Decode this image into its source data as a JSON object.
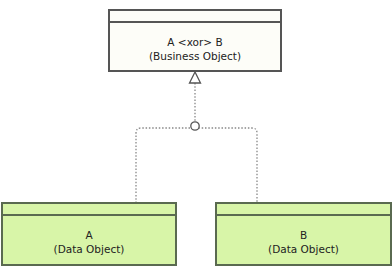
{
  "diagram": {
    "nodes": [
      {
        "id": "top",
        "line1": "A <xor> B",
        "line2": "(Business Object)",
        "fill": "#fdfdf8"
      },
      {
        "id": "a",
        "line1": "A",
        "line2": "(Data Object)",
        "fill": "#d8f5a8"
      },
      {
        "id": "b",
        "line1": "B",
        "line2": "(Data Object)",
        "fill": "#d8f5a8"
      }
    ],
    "edges": [
      {
        "from": "a",
        "to": "top",
        "type": "realization-xor-junction",
        "style": "dotted"
      },
      {
        "from": "b",
        "to": "top",
        "type": "realization-xor-junction",
        "style": "dotted"
      }
    ]
  }
}
